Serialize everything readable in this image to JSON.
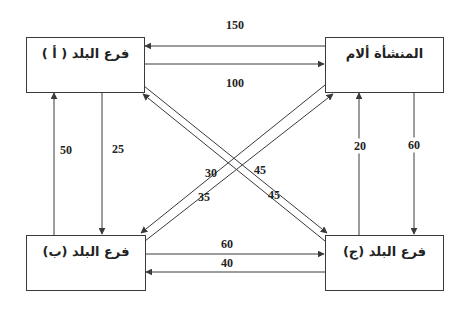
{
  "diagram": {
    "title": "",
    "nodes": {
      "branch_a": {
        "label": "فرع البلد ( أ )"
      },
      "parent": {
        "label": "المنشأة ألام"
      },
      "branch_b": {
        "label": "فرع البلد (ب)"
      },
      "branch_c": {
        "label": "فرع البلد (ج)"
      }
    },
    "flows": {
      "parent_to_a": {
        "from": "parent",
        "to": "branch_a",
        "value": "150"
      },
      "a_to_parent": {
        "from": "branch_a",
        "to": "parent",
        "value": "100"
      },
      "b_to_a": {
        "from": "branch_b",
        "to": "branch_a",
        "value": "50"
      },
      "a_to_b": {
        "from": "branch_a",
        "to": "branch_b",
        "value": "25"
      },
      "c_to_parent": {
        "from": "branch_c",
        "to": "parent",
        "value": "20"
      },
      "parent_to_c": {
        "from": "parent",
        "to": "branch_c",
        "value": "60"
      },
      "b_to_c": {
        "from": "branch_b",
        "to": "branch_c",
        "value": "60"
      },
      "c_to_b": {
        "from": "branch_c",
        "to": "branch_b",
        "value": "40"
      },
      "parent_to_b": {
        "from": "parent",
        "to": "branch_b",
        "value": "30"
      },
      "b_to_parent": {
        "from": "branch_b",
        "to": "parent",
        "value": "35"
      },
      "a_to_c": {
        "from": "branch_a",
        "to": "branch_c",
        "value": "45"
      },
      "c_to_a": {
        "from": "branch_c",
        "to": "branch_a",
        "value": "45"
      }
    },
    "colors": {
      "line": "#3a3a3a",
      "text": "#222222",
      "background": "#ffffff"
    }
  }
}
